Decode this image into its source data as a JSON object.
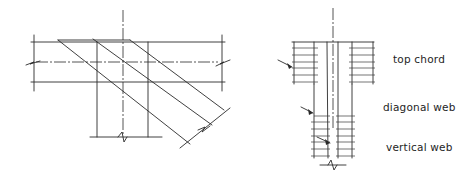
{
  "diagrams": [
    {
      "id": "left",
      "description": "Plan view of truss joint with top chord, diagonal web and vertical web (line drawing)"
    },
    {
      "id": "right",
      "description": "Section view of truss members with hatched labels",
      "labels": {
        "top_chord": "top chord",
        "diagonal_web": "diagonal web",
        "vertical_web": "vertical web"
      }
    }
  ],
  "colors": {
    "line": "#2a2a2a",
    "background": "#ffffff"
  }
}
